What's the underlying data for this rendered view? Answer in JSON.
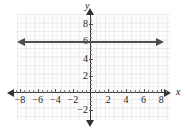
{
  "chart_data": {
    "type": "line",
    "title": "",
    "xlabel": "x",
    "ylabel": "y",
    "xlim": [
      -9,
      9
    ],
    "ylim": [
      -2.5,
      9
    ],
    "grid": true,
    "legend": "none",
    "x_ticks": [
      -8,
      -6,
      -4,
      -2,
      2,
      4,
      6,
      8
    ],
    "x_tick_labels": [
      "−8",
      "−6",
      "−4",
      "−2",
      "2",
      "4",
      "6",
      "8"
    ],
    "y_ticks": [
      8,
      6,
      4,
      2,
      -2
    ],
    "y_tick_labels": [
      "8",
      "6",
      "4",
      "2",
      "−2"
    ],
    "series": [
      {
        "name": "y = 6",
        "type": "horizontal-line",
        "equation": "y = 6",
        "y_value": 6,
        "color": "#4d4d4d",
        "x_start": -8.5,
        "x_end": 8.5,
        "arrows": "both",
        "values": [
          6,
          6,
          6,
          6,
          6,
          6,
          6,
          6,
          6
        ],
        "x": [
          -8.5,
          -6,
          -4,
          -2,
          0,
          2,
          4,
          6,
          8.5
        ]
      }
    ],
    "colors": {
      "axis": "#333333",
      "grid_major": "#eceaea",
      "grid_minor": "#f4f1f2",
      "line": "#4d4d4d",
      "text": "#1a1a1a",
      "background": "#ffffff"
    }
  },
  "axes": {
    "y_name": "y",
    "x_name": "x"
  }
}
